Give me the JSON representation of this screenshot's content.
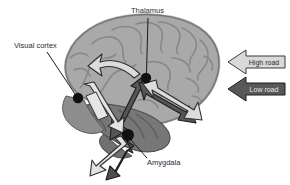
{
  "figure": {
    "background_color": "#ffffff"
  },
  "brain": {
    "name": "brain-lateral-view",
    "cortex_color": "#a9a9a9",
    "cortex_outline_color": "#6e6e6e",
    "sulci_color": "#8a8a8a",
    "temporal_lobe_color": "#7a7a7a",
    "cerebellum_color": "#8f8f8f"
  },
  "annotations": [
    {
      "id": "thalamus",
      "label": "Thalamus",
      "marker_color": "#111111",
      "marker": {
        "x": 146,
        "y": 78,
        "r": 5.2
      },
      "leader": {
        "x1": 148,
        "y1": 18,
        "x2": 146.5,
        "y2": 73
      },
      "text": {
        "x": 131,
        "y": 13,
        "anchor": "start"
      }
    },
    {
      "id": "visual-cortex",
      "label": "Visual cortex",
      "marker_color": "#111111",
      "marker": {
        "x": 78,
        "y": 98,
        "r": 5.2
      },
      "leader": {
        "x1": 47,
        "y1": 52,
        "x2": 75,
        "y2": 94
      },
      "text": {
        "x": 14,
        "y": 48,
        "anchor": "start"
      }
    },
    {
      "id": "amygdala",
      "label": "Amygdala",
      "marker_color": "#111111",
      "marker": {
        "x": 128,
        "y": 135,
        "r": 6.0
      },
      "leader": {
        "x1": 131,
        "y1": 140,
        "x2": 147,
        "y2": 158
      },
      "text": {
        "x": 147,
        "y": 165,
        "anchor": "start"
      }
    }
  ],
  "pathways": {
    "high_road_color": "#d9d9d9",
    "high_road_outline": "#2f2f2f",
    "low_road_color": "#555555",
    "low_road_outline": "#1c1c1c"
  },
  "legend": {
    "name": "pathway-legend",
    "items": [
      {
        "id": "high-road",
        "label": "High road",
        "fill": "#d9d9d9",
        "stroke": "#3a3a3a",
        "text_color": "#2b2b2b",
        "direction": "left"
      },
      {
        "id": "low-road",
        "label": "Low road",
        "fill": "#585858",
        "stroke": "#1c1c1c",
        "text_color": "#e8e8e8",
        "direction": "left"
      }
    ]
  }
}
